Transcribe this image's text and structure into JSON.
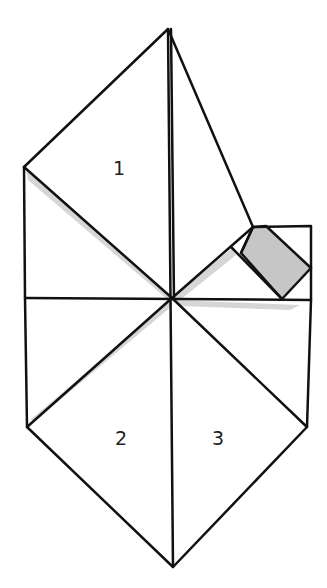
{
  "diagram": {
    "type": "origami-folding-diagram",
    "colors": {
      "line": "#111111",
      "shade": "#c8c8c8",
      "shadow": "#d9d9d9",
      "background": "#ffffff"
    },
    "labels": [
      {
        "id": "region-1",
        "text": "1",
        "x": 118,
        "y": 175
      },
      {
        "id": "region-2",
        "text": "2",
        "x": 121,
        "y": 445
      },
      {
        "id": "region-3",
        "text": "3",
        "x": 218,
        "y": 445
      }
    ],
    "points": {
      "top": [
        168,
        29
      ],
      "left_upper": [
        24,
        167
      ],
      "left_mid": [
        25,
        298
      ],
      "left_lower": [
        27,
        427
      ],
      "bottom": [
        173,
        567
      ],
      "right_lower": [
        307,
        427
      ],
      "right_mid": [
        311,
        300
      ],
      "square_tl": [
        253,
        227
      ],
      "square_tr": [
        311,
        226
      ],
      "center": [
        172,
        298
      ]
    }
  }
}
